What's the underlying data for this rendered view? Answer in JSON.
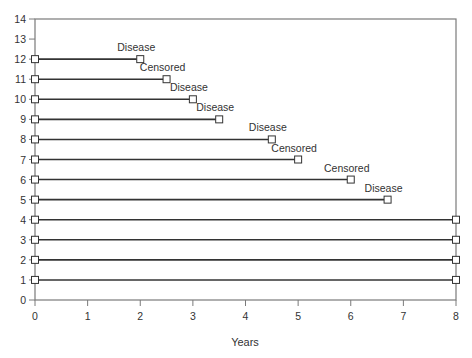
{
  "chart_data": {
    "type": "line",
    "subtype": "follow-up timeline (subject swimlane)",
    "title": "",
    "xlabel": "Years",
    "ylabel": "",
    "xlim": [
      0,
      8
    ],
    "ylim": [
      0,
      14
    ],
    "x_ticks": [
      0,
      1,
      2,
      3,
      4,
      5,
      6,
      7,
      8
    ],
    "y_ticks": [
      0,
      1,
      2,
      3,
      4,
      5,
      6,
      7,
      8,
      9,
      10,
      11,
      12,
      13,
      14
    ],
    "grid": false,
    "frame": "box",
    "legend": null,
    "marker": "open-square",
    "subjects": [
      {
        "id": 12,
        "start": 0,
        "end": 2.0,
        "outcome": "Disease"
      },
      {
        "id": 11,
        "start": 0,
        "end": 2.5,
        "outcome": "Censored"
      },
      {
        "id": 10,
        "start": 0,
        "end": 3.0,
        "outcome": "Disease"
      },
      {
        "id": 9,
        "start": 0,
        "end": 3.5,
        "outcome": "Disease"
      },
      {
        "id": 8,
        "start": 0,
        "end": 4.5,
        "outcome": "Disease"
      },
      {
        "id": 7,
        "start": 0,
        "end": 5.0,
        "outcome": "Censored"
      },
      {
        "id": 6,
        "start": 0,
        "end": 6.0,
        "outcome": "Censored"
      },
      {
        "id": 5,
        "start": 0,
        "end": 6.7,
        "outcome": "Disease"
      },
      {
        "id": 4,
        "start": 0,
        "end": 8.0,
        "outcome": ""
      },
      {
        "id": 3,
        "start": 0,
        "end": 8.0,
        "outcome": ""
      },
      {
        "id": 2,
        "start": 0,
        "end": 8.0,
        "outcome": ""
      },
      {
        "id": 1,
        "start": 0,
        "end": 8.0,
        "outcome": ""
      }
    ]
  },
  "colors": {
    "line": "#333333",
    "frame": "#7a7a7a",
    "text": "#333333",
    "marker_fill": "#ffffff"
  }
}
